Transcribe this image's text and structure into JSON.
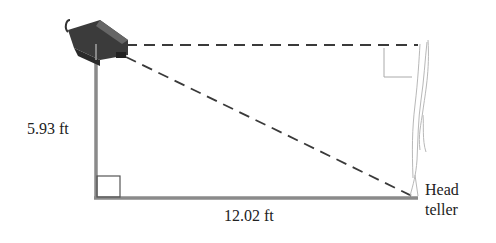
{
  "diagram": {
    "type": "right-triangle-word-problem",
    "labels": {
      "vertical_side": "5.93 ft",
      "horizontal_side": "12.02 ft",
      "person_line1": "Head",
      "person_line2": "teller"
    },
    "elements": {
      "camera": "security-camera",
      "person": "head-teller-sketch"
    },
    "colors": {
      "solid_side": "#8a8a8a",
      "dashed": "#3a3a3a",
      "sketch": "#b8b8b8",
      "text": "#222222"
    }
  }
}
